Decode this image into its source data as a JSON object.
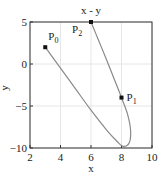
{
  "chart_data": {
    "type": "line",
    "title": "x - y",
    "xlabel": "x",
    "ylabel": "y",
    "xlim": [
      2,
      10
    ],
    "ylim": [
      -10,
      5
    ],
    "xticks": [
      2,
      4,
      6,
      8,
      10
    ],
    "yticks": [
      5,
      0,
      -5,
      -10
    ],
    "xtick_labels": [
      "2",
      "4",
      "6",
      "8",
      "10"
    ],
    "ytick_labels": [
      "5",
      "0",
      "−5",
      "−10"
    ],
    "grid": true,
    "legend": null,
    "series": [
      {
        "name": "curve",
        "color": "#8a8a8a",
        "x": [
          3,
          4,
          5,
          6,
          7,
          7.7,
          8.1,
          8.5,
          8.6,
          8.4,
          8,
          7.5,
          7,
          6.5,
          6
        ],
        "y": [
          2,
          -0.5,
          -3,
          -5.5,
          -7.8,
          -9.2,
          -9.8,
          -9.4,
          -8,
          -6,
          -4,
          -1.7,
          0.6,
          2.8,
          5
        ]
      }
    ],
    "points": [
      {
        "label": "P",
        "sub": "0",
        "x": 3,
        "y": 2
      },
      {
        "label": "P",
        "sub": "1",
        "x": 8,
        "y": -4
      },
      {
        "label": "P",
        "sub": "2",
        "x": 6,
        "y": 5
      }
    ]
  }
}
